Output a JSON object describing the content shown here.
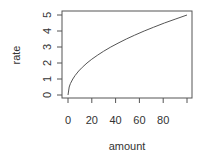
{
  "chart_data": {
    "type": "line",
    "title": "",
    "xlabel": "amount",
    "ylabel": "rate",
    "xlim": [
      0,
      100
    ],
    "ylim": [
      0,
      5
    ],
    "x_ticks": [
      0,
      20,
      40,
      60,
      80,
      100
    ],
    "x_tick_labels": [
      "0",
      "20",
      "40",
      "60",
      "80",
      ""
    ],
    "y_ticks": [
      0,
      1,
      2,
      3,
      4,
      5
    ],
    "y_tick_labels": [
      "0",
      "1",
      "2",
      "3",
      "4",
      "5"
    ],
    "grid": false,
    "legend": null,
    "series": [
      {
        "name": "rate",
        "x": [
          0,
          1,
          2,
          4,
          6,
          9,
          12,
          16,
          20,
          25,
          30,
          36,
          42,
          49,
          56,
          64,
          72,
          81,
          90,
          100
        ],
        "values": [
          0,
          0.5,
          0.71,
          1.0,
          1.22,
          1.5,
          1.73,
          2.0,
          2.24,
          2.5,
          2.74,
          3.0,
          3.24,
          3.5,
          3.74,
          4.0,
          4.24,
          4.5,
          4.74,
          5.0
        ]
      }
    ]
  }
}
